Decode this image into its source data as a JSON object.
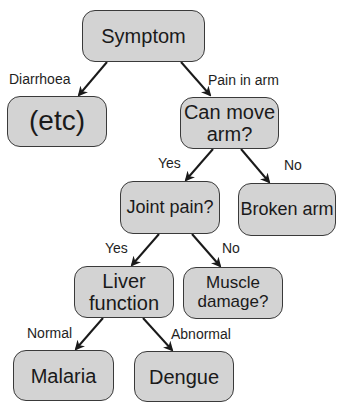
{
  "diagram": {
    "type": "decision-tree",
    "colors": {
      "node_fill": "#d3d3d3",
      "node_border": "#3a3a3a",
      "edge": "#1a1a1a",
      "text": "#1a1a1a"
    },
    "nodes": {
      "symptom": "Symptom",
      "etc": "(etc)",
      "can_move_arm_line1": "Can move",
      "can_move_arm_line2": "arm?",
      "joint_pain": "Joint pain?",
      "broken_arm": "Broken arm",
      "liver_function_line1": "Liver",
      "liver_function_line2": "function",
      "muscle_damage_line1": "Muscle",
      "muscle_damage_line2": "damage?",
      "malaria": "Malaria",
      "dengue": "Dengue"
    },
    "edges": [
      {
        "from": "Symptom",
        "to": "(etc)",
        "label": "Diarrhoea"
      },
      {
        "from": "Symptom",
        "to": "Can move arm?",
        "label": "Pain in arm"
      },
      {
        "from": "Can move arm?",
        "to": "Joint pain?",
        "label": "Yes"
      },
      {
        "from": "Can move arm?",
        "to": "Broken arm",
        "label": "No"
      },
      {
        "from": "Joint pain?",
        "to": "Liver function",
        "label": "Yes"
      },
      {
        "from": "Joint pain?",
        "to": "Muscle damage?",
        "label": "No"
      },
      {
        "from": "Liver function",
        "to": "Malaria",
        "label": "Normal"
      },
      {
        "from": "Liver function",
        "to": "Dengue",
        "label": "Abnormal"
      }
    ]
  }
}
